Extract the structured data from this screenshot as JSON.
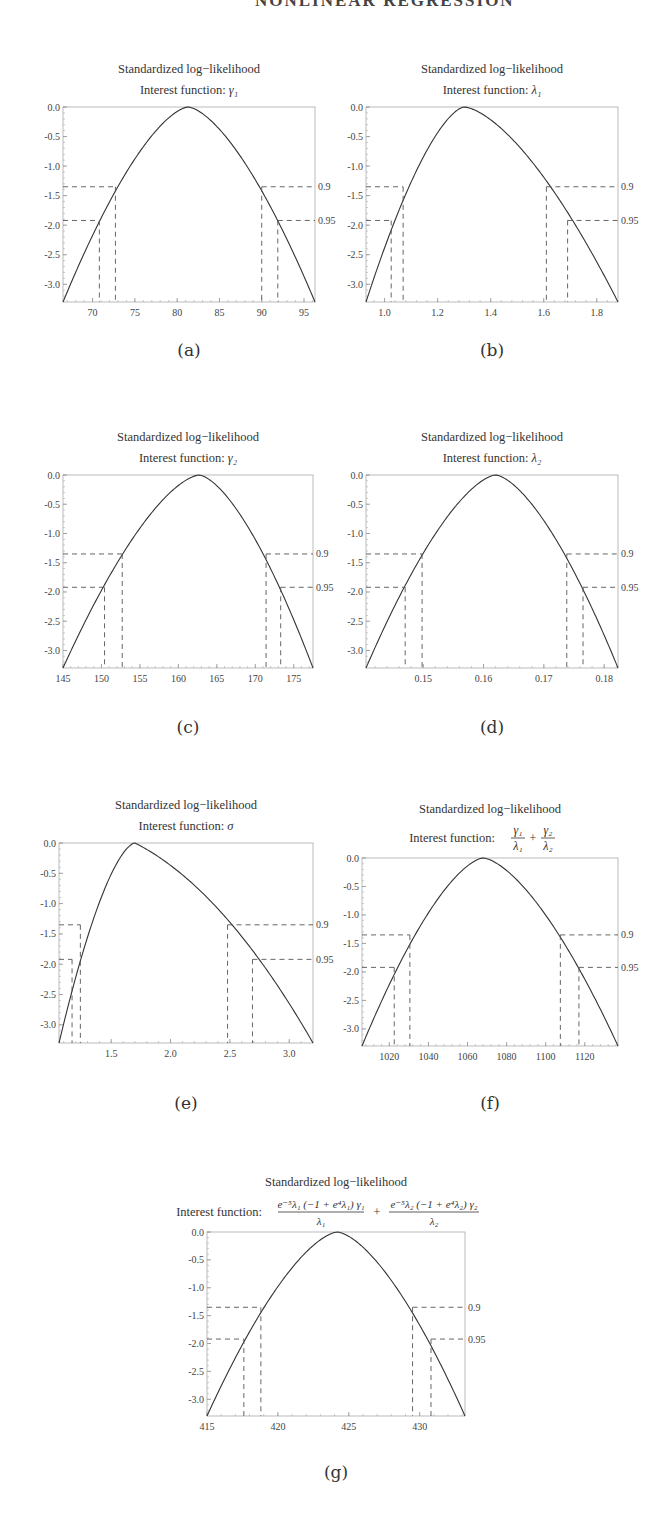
{
  "page": {
    "header_fragment": "NONLINEAR REGRESSION"
  },
  "chart_data": [
    {
      "id": "a",
      "type": "line",
      "caption": "(a)",
      "title": "Standardized log−likelihood",
      "subtitle_prefix": "Interest function: ",
      "subtitle_math": "γ₁",
      "xlabel": "",
      "ylabel": "",
      "xlim": [
        66.5,
        96.3
      ],
      "ylim": [
        -3.3,
        0.0
      ],
      "xticks": [
        70,
        75,
        80,
        85,
        90,
        95
      ],
      "xtick_labels": [
        "70",
        "75",
        "80",
        "85",
        "90",
        "95"
      ],
      "yticks": [
        0.0,
        -0.5,
        -1.0,
        -1.5,
        -2.0,
        -2.5,
        -3.0
      ],
      "ytick_labels": [
        "0.0",
        "-0.5",
        "-1.0",
        "-1.5",
        "-2.0",
        "-2.5",
        "-3.0"
      ],
      "peak_x": 81.3,
      "levels": [
        {
          "label": "0.9",
          "y": -1.35,
          "x_left": 72.7,
          "x_right": 90.0
        },
        {
          "label": "0.95",
          "y": -1.92,
          "x_left": 70.8,
          "x_right": 91.9
        }
      ],
      "skew": 0.0,
      "frame": {
        "x": 63,
        "y": 107,
        "w": 252,
        "h": 195
      },
      "title_y": 73,
      "subtitle_y": 94,
      "caption_y": 340
    },
    {
      "id": "b",
      "type": "line",
      "caption": "(b)",
      "title": "Standardized log−likelihood",
      "subtitle_prefix": "Interest function: ",
      "subtitle_math": "λ₁",
      "xlabel": "",
      "ylabel": "",
      "xlim": [
        0.93,
        1.88
      ],
      "ylim": [
        -3.3,
        0.0
      ],
      "xticks": [
        1.0,
        1.2,
        1.4,
        1.6,
        1.8
      ],
      "xtick_labels": [
        "1.0",
        "1.2",
        "1.4",
        "1.6",
        "1.8"
      ],
      "yticks": [
        0.0,
        -0.5,
        -1.0,
        -1.5,
        -2.0,
        -2.5,
        -3.0
      ],
      "ytick_labels": [
        "0.0",
        "-0.5",
        "-1.0",
        "-1.5",
        "-2.0",
        "-2.5",
        "-3.0"
      ],
      "peak_x": 1.3,
      "levels": [
        {
          "label": "0.9",
          "y": -1.35,
          "x_left": 1.07,
          "x_right": 1.61
        },
        {
          "label": "0.95",
          "y": -1.92,
          "x_left": 1.025,
          "x_right": 1.69
        }
      ],
      "skew": 0.18,
      "frame": {
        "x": 366,
        "y": 107,
        "w": 252,
        "h": 195
      },
      "title_y": 73,
      "subtitle_y": 94,
      "caption_y": 340
    },
    {
      "id": "c",
      "type": "line",
      "caption": "(c)",
      "title": "Standardized log−likelihood",
      "subtitle_prefix": "Interest function: ",
      "subtitle_math": "γ₂",
      "xlabel": "",
      "ylabel": "",
      "xlim": [
        145.0,
        177.5
      ],
      "ylim": [
        -3.3,
        0.0
      ],
      "xticks": [
        145,
        150,
        155,
        160,
        165,
        170,
        175
      ],
      "xtick_labels": [
        "145",
        "150",
        "155",
        "160",
        "165",
        "170",
        "175"
      ],
      "yticks": [
        0.0,
        -0.5,
        -1.0,
        -1.5,
        -2.0,
        -2.5,
        -3.0
      ],
      "ytick_labels": [
        "0.0",
        "-0.5",
        "-1.0",
        "-1.5",
        "-2.0",
        "-2.5",
        "-3.0"
      ],
      "peak_x": 162.7,
      "levels": [
        {
          "label": "0.9",
          "y": -1.35,
          "x_left": 152.7,
          "x_right": 171.4
        },
        {
          "label": "0.95",
          "y": -1.92,
          "x_left": 150.4,
          "x_right": 173.3
        }
      ],
      "skew": -0.05,
      "frame": {
        "x": 63,
        "y": 475,
        "w": 250,
        "h": 193
      },
      "title_y": 441,
      "subtitle_y": 462,
      "caption_y": 717
    },
    {
      "id": "d",
      "type": "line",
      "caption": "(d)",
      "title": "Standardized log−likelihood",
      "subtitle_prefix": "Interest function: ",
      "subtitle_math": "λ₂",
      "xlabel": "",
      "ylabel": "",
      "xlim": [
        0.1405,
        0.1823
      ],
      "ylim": [
        -3.3,
        0.0
      ],
      "xticks": [
        0.15,
        0.16,
        0.17,
        0.18
      ],
      "xtick_labels": [
        "0.15",
        "0.16",
        "0.17",
        "0.18"
      ],
      "yticks": [
        0.0,
        -0.5,
        -1.0,
        -1.5,
        -2.0,
        -2.5,
        -3.0
      ],
      "ytick_labels": [
        "0.0",
        "-0.5",
        "-1.0",
        "-1.5",
        "-2.0",
        "-2.5",
        "-3.0"
      ],
      "peak_x": 0.162,
      "levels": [
        {
          "label": "0.9",
          "y": -1.35,
          "x_left": 0.1498,
          "x_right": 0.1738
        },
        {
          "label": "0.95",
          "y": -1.92,
          "x_left": 0.147,
          "x_right": 0.1765
        }
      ],
      "skew": 0.0,
      "frame": {
        "x": 366,
        "y": 475,
        "w": 252,
        "h": 193
      },
      "title_y": 441,
      "subtitle_y": 462,
      "caption_y": 717
    },
    {
      "id": "e",
      "type": "line",
      "caption": "(e)",
      "title": "Standardized log−likelihood",
      "subtitle_prefix": "Interest function: ",
      "subtitle_math": "σ",
      "xlabel": "",
      "ylabel": "",
      "xlim": [
        1.06,
        3.2
      ],
      "ylim": [
        -3.3,
        0.0
      ],
      "xticks": [
        1.5,
        2.0,
        2.5,
        3.0
      ],
      "xtick_labels": [
        "1.5",
        "2.0",
        "2.5",
        "3.0"
      ],
      "yticks": [
        0.0,
        -0.5,
        -1.0,
        -1.5,
        -2.0,
        -2.5,
        -3.0
      ],
      "ytick_labels": [
        "0.0",
        "-0.5",
        "-1.0",
        "-1.5",
        "-2.0",
        "-2.5",
        "-3.0"
      ],
      "peak_x": 1.7,
      "levels": [
        {
          "label": "0.9",
          "y": -1.35,
          "x_left": 1.24,
          "x_right": 2.48
        },
        {
          "label": "0.95",
          "y": -1.92,
          "x_left": 1.17,
          "x_right": 2.69
        }
      ],
      "skew": 0.6,
      "frame": {
        "x": 59,
        "y": 843,
        "w": 254,
        "h": 200
      },
      "title_y": 809,
      "subtitle_y": 830,
      "caption_y": 1093
    },
    {
      "id": "f",
      "type": "line",
      "caption": "(f)",
      "title": "Standardized log−likelihood",
      "subtitle_prefix": "Interest function: ",
      "subtitle_math": "γ₁/λ₁ + γ₂/λ₂",
      "xlabel": "",
      "ylabel": "",
      "xlim": [
        1006,
        1137
      ],
      "ylim": [
        -3.3,
        0.0
      ],
      "xticks": [
        1020,
        1040,
        1060,
        1080,
        1100,
        1120
      ],
      "xtick_labels": [
        "1020",
        "1040",
        "1060",
        "1080",
        "1100",
        "1120"
      ],
      "yticks": [
        0.0,
        -0.5,
        -1.0,
        -1.5,
        -2.0,
        -2.5,
        -3.0
      ],
      "ytick_labels": [
        "0.0",
        "-0.5",
        "-1.0",
        "-1.5",
        "-2.0",
        "-2.5",
        "-3.0"
      ],
      "peak_x": 1068,
      "levels": [
        {
          "label": "0.9",
          "y": -1.35,
          "x_left": 1030.5,
          "x_right": 1107.5
        },
        {
          "label": "0.95",
          "y": -1.92,
          "x_left": 1022.5,
          "x_right": 1117
        }
      ],
      "skew": 0.05,
      "frame": {
        "x": 362,
        "y": 858,
        "w": 256,
        "h": 188
      },
      "title_y": 813,
      "subtitle_y": 838,
      "caption_y": 1093
    },
    {
      "id": "g",
      "type": "line",
      "caption": "(g)",
      "title": "Standardized log−likelihood",
      "subtitle_prefix": "Interest function: ",
      "subtitle_math": "e^(−5λ₁)(−1 + e^(4λ₁))γ₁/λ₁ + e^(−5λ₂)(−1 + e^(4λ₂))γ₂/λ₂",
      "xlabel": "",
      "ylabel": "",
      "xlim": [
        415.0,
        433.2
      ],
      "ylim": [
        -3.3,
        0.0
      ],
      "xticks": [
        415,
        420,
        425,
        430
      ],
      "xtick_labels": [
        "415",
        "420",
        "425",
        "430"
      ],
      "yticks": [
        0.0,
        -0.5,
        -1.0,
        -1.5,
        -2.0,
        -2.5,
        -3.0
      ],
      "ytick_labels": [
        "0.0",
        "-0.5",
        "-1.0",
        "-1.5",
        "-2.0",
        "-2.5",
        "-3.0"
      ],
      "peak_x": 424.2,
      "levels": [
        {
          "label": "0.9",
          "y": -1.35,
          "x_left": 418.8,
          "x_right": 429.5
        },
        {
          "label": "0.95",
          "y": -1.92,
          "x_left": 417.6,
          "x_right": 430.8
        }
      ],
      "skew": 0.0,
      "frame": {
        "x": 207,
        "y": 1232,
        "w": 258,
        "h": 184
      },
      "title_y": 1186,
      "subtitle_y": 1212,
      "caption_y": 1462
    }
  ]
}
